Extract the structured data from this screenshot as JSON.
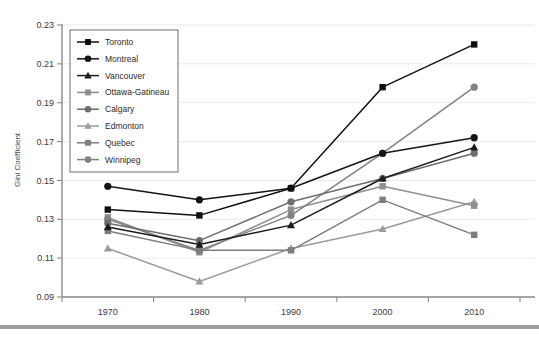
{
  "chart_data": {
    "type": "line",
    "title": "",
    "xlabel": "",
    "ylabel": "Gini Coefficient",
    "categories": [
      "1970",
      "1980",
      "1990",
      "2000",
      "2010"
    ],
    "x": [
      1970,
      1980,
      1990,
      2000,
      2010
    ],
    "ylim": [
      0.09,
      0.23
    ],
    "ytick_labels": [
      "0.09",
      "0.11",
      "0.13",
      "0.15",
      "0.17",
      "0.19",
      "0.21",
      "0.23"
    ],
    "ytick_values": [
      0.09,
      0.11,
      0.13,
      0.15,
      0.17,
      0.19,
      0.21,
      0.23
    ],
    "grid": true,
    "legend_position": "upper-left-inside",
    "series": [
      {
        "name": "Toronto",
        "marker": "square",
        "color": "#111111",
        "values": [
          0.135,
          0.132,
          0.146,
          0.198,
          0.22
        ]
      },
      {
        "name": "Montreal",
        "marker": "circle",
        "color": "#141414",
        "values": [
          0.147,
          0.14,
          0.146,
          0.164,
          0.172
        ]
      },
      {
        "name": "Vancouver",
        "marker": "triangle",
        "color": "#1c1c1c",
        "values": [
          0.126,
          0.117,
          0.127,
          0.151,
          0.167
        ]
      },
      {
        "name": "Ottawa-Gatineau",
        "marker": "square",
        "color": "#8f8f8f",
        "values": [
          0.131,
          0.113,
          0.135,
          0.147,
          0.137
        ]
      },
      {
        "name": "Calgary",
        "marker": "circle",
        "color": "#6e6e6e",
        "values": [
          0.128,
          0.119,
          0.139,
          0.151,
          0.164
        ]
      },
      {
        "name": "Edmonton",
        "marker": "triangle",
        "color": "#9b9b9b",
        "values": [
          0.115,
          0.098,
          0.115,
          0.125,
          0.139
        ]
      },
      {
        "name": "Quebec",
        "marker": "square",
        "color": "#7d7d7d",
        "values": [
          0.124,
          0.114,
          0.114,
          0.14,
          0.122
        ]
      },
      {
        "name": "Winnipeg",
        "marker": "circle",
        "color": "#828282",
        "values": [
          0.13,
          0.114,
          0.132,
          0.164,
          0.198
        ]
      }
    ]
  },
  "caption": {
    "text": ""
  }
}
